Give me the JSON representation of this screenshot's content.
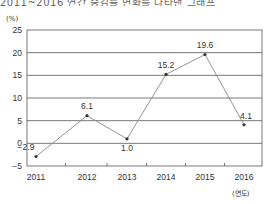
{
  "header": {
    "truncated_text": "2011~2016 연간 증감률 변화를 나타낸 그래프"
  },
  "chart_data": {
    "type": "line",
    "title": "",
    "xlabel": "(연도)",
    "ylabel": "(%)",
    "categories": [
      "2011",
      "2012",
      "2013",
      "2014",
      "2015",
      "2016"
    ],
    "series": [
      {
        "name": "증감률",
        "values": [
          -2.9,
          6.1,
          1.0,
          15.2,
          19.6,
          4.1
        ]
      }
    ],
    "data_labels": [
      "−2.9",
      "6.1",
      "1.0",
      "15.2",
      "19.6",
      "4.1"
    ],
    "yticks": [
      25,
      20,
      15,
      10,
      5,
      0,
      -5
    ],
    "ytick_labels": [
      "25",
      "20",
      "15",
      "10",
      "5",
      "0",
      "−5"
    ],
    "ylim": [
      -5,
      25
    ],
    "grid": true,
    "legend": "none",
    "colors": {
      "line": "#888888",
      "marker": "#333333",
      "grid": "#555555",
      "frame": "#555555"
    }
  }
}
